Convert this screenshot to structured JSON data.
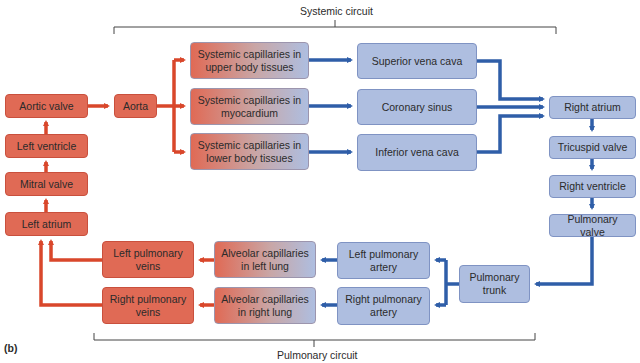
{
  "figure_label": "(b)",
  "systemic": {
    "label": "Systemic circuit"
  },
  "pulmonary": {
    "label": "Pulmonary circuit"
  },
  "colors": {
    "oxygenated": "#e06a55",
    "deoxygenated": "#aebee0",
    "oxy_arrow": "#d9472b",
    "deoxy_arrow": "#2f5ea8"
  },
  "nodes": {
    "aortic_valve": "Aortic valve",
    "left_ventricle": "Left ventricle",
    "mitral_valve": "Mitral valve",
    "left_atrium": "Left atrium",
    "aorta": "Aorta",
    "cap_upper": "Systemic capillaries in upper body tissues",
    "cap_myo": "Systemic capillaries in myocardium",
    "cap_lower": "Systemic capillaries in lower body tissues",
    "svc": "Superior vena cava",
    "coronary_sinus": "Coronary sinus",
    "ivc": "Inferior vena cava",
    "right_atrium": "Right atrium",
    "tricuspid_valve": "Tricuspid valve",
    "right_ventricle": "Right ventricle",
    "pulmonary_valve": "Pulmonary valve",
    "pulmonary_trunk": "Pulmonary trunk",
    "left_pulm_artery": "Left pulmonary artery",
    "right_pulm_artery": "Right pulmonary artery",
    "alv_left": "Alveolar capillaries in left lung",
    "alv_right": "Alveolar capillaries in right lung",
    "left_pulm_veins": "Left pulmonary veins",
    "right_pulm_veins": "Right pulmonary veins"
  }
}
